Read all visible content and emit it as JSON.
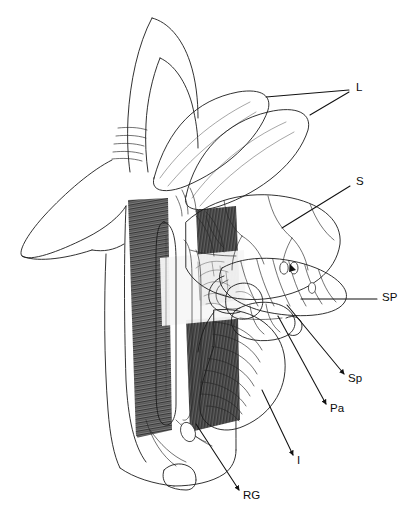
{
  "figure": {
    "domain_type": "scientific-anatomical-illustration",
    "style": "black-and-white stipple and line engraving",
    "background_color": "#ffffff",
    "ink_color": "#111111",
    "width": 406,
    "height": 511
  },
  "labels": [
    {
      "id": "L",
      "text": "L",
      "meaning": "Liver lobes",
      "text_x": 356,
      "text_y": 88,
      "leaders": [
        {
          "x1": 349,
          "y1": 90,
          "x2": 266,
          "y2": 97
        },
        {
          "x1": 349,
          "y1": 92,
          "x2": 310,
          "y2": 115
        }
      ],
      "arrow": "none"
    },
    {
      "id": "S",
      "text": "S",
      "meaning": "Stomach",
      "text_x": 356,
      "text_y": 182,
      "leaders": [
        {
          "x1": 350,
          "y1": 186,
          "x2": 282,
          "y2": 228
        }
      ],
      "arrow": "none"
    },
    {
      "id": "SP",
      "text": "SP",
      "meaning": "Spiral valve",
      "text_x": 382,
      "text_y": 298,
      "leaders": [
        {
          "x1": 377,
          "y1": 299,
          "x2": 301,
          "y2": 299
        }
      ],
      "arrow": "none"
    },
    {
      "id": "Sp",
      "text": "Sp",
      "meaning": "Spleen",
      "text_x": 348,
      "text_y": 379,
      "leaders": [
        {
          "x1": 344,
          "y1": 374,
          "x2": 287,
          "y2": 305
        }
      ],
      "arrow": "start"
    },
    {
      "id": "Pa",
      "text": "Pa",
      "meaning": "Pancreas",
      "text_x": 330,
      "text_y": 409,
      "leaders": [
        {
          "x1": 326,
          "y1": 404,
          "x2": 278,
          "y2": 316
        }
      ],
      "arrow": "start"
    },
    {
      "id": "I",
      "text": "I",
      "meaning": "Intestine",
      "text_x": 297,
      "text_y": 461,
      "leaders": [
        {
          "x1": 293,
          "y1": 455,
          "x2": 262,
          "y2": 390
        }
      ],
      "arrow": "start"
    },
    {
      "id": "RG",
      "text": "RG",
      "meaning": "Rectal gland",
      "text_x": 243,
      "text_y": 496,
      "leaders": [
        {
          "x1": 239,
          "y1": 490,
          "x2": 196,
          "y2": 424
        }
      ],
      "arrow": "start"
    }
  ],
  "structures": [
    {
      "name": "pectoral-fin",
      "tone": "outline-only"
    },
    {
      "name": "gill-slits",
      "count": 5,
      "tone": "thin-lines"
    },
    {
      "name": "liver-lobe-upper",
      "tone": "stipple-medium"
    },
    {
      "name": "liver-lobe-lower",
      "tone": "stipple-light"
    },
    {
      "name": "stomach",
      "tone": "stipple-medium"
    },
    {
      "name": "spiral-valve",
      "tone": "stipple-banded"
    },
    {
      "name": "spleen",
      "tone": "stipple-dark"
    },
    {
      "name": "pancreas",
      "tone": "stipple-medium"
    },
    {
      "name": "intestine",
      "tone": "stipple-banded"
    },
    {
      "name": "rectal-gland",
      "tone": "stipple-light"
    },
    {
      "name": "body-wall-muscle",
      "tone": "dense-hatching"
    },
    {
      "name": "mesentery-vessels",
      "tone": "fine-branching"
    }
  ]
}
